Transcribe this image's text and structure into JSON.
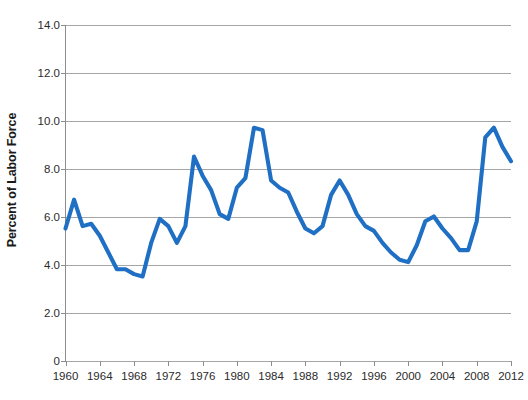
{
  "chart_data": {
    "type": "line",
    "title": "",
    "xlabel": "",
    "ylabel": "Percent of Labor Force",
    "ylim": [
      0,
      14
    ],
    "xlim": [
      1960,
      2012
    ],
    "grid": true,
    "legend": false,
    "line_color": "#1f6fc4",
    "y_ticks": [
      "0",
      "2.0",
      "4.0",
      "6.0",
      "8.0",
      "10.0",
      "12.0",
      "14.0"
    ],
    "y_tick_values": [
      0,
      2,
      4,
      6,
      8,
      10,
      12,
      14
    ],
    "x_ticks": [
      "1960",
      "1964",
      "1968",
      "1972",
      "1976",
      "1980",
      "1984",
      "1988",
      "1992",
      "1996",
      "2000",
      "2004",
      "2008",
      "2012"
    ],
    "x_tick_values": [
      1960,
      1964,
      1968,
      1972,
      1976,
      1980,
      1984,
      1988,
      1992,
      1996,
      2000,
      2004,
      2008,
      2012
    ],
    "series": [
      {
        "name": "Percent of Labor Force",
        "x": [
          1960,
          1961,
          1962,
          1963,
          1964,
          1965,
          1966,
          1967,
          1968,
          1969,
          1970,
          1971,
          1972,
          1973,
          1974,
          1975,
          1976,
          1977,
          1978,
          1979,
          1980,
          1981,
          1982,
          1983,
          1984,
          1985,
          1986,
          1987,
          1988,
          1989,
          1990,
          1991,
          1992,
          1993,
          1994,
          1995,
          1996,
          1997,
          1998,
          1999,
          2000,
          2001,
          2002,
          2003,
          2004,
          2005,
          2006,
          2007,
          2008,
          2009,
          2010,
          2011,
          2012
        ],
        "values": [
          5.5,
          6.7,
          5.6,
          5.7,
          5.2,
          4.5,
          3.8,
          3.8,
          3.6,
          3.5,
          4.9,
          5.9,
          5.6,
          4.9,
          5.6,
          8.5,
          7.7,
          7.1,
          6.1,
          5.9,
          7.2,
          7.6,
          9.7,
          9.6,
          7.5,
          7.2,
          7.0,
          6.2,
          5.5,
          5.3,
          5.6,
          6.9,
          7.5,
          6.9,
          6.1,
          5.6,
          5.4,
          4.9,
          4.5,
          4.2,
          4.1,
          4.8,
          5.8,
          6.0,
          5.5,
          5.1,
          4.6,
          4.6,
          5.8,
          9.3,
          9.7,
          8.9,
          8.3
        ]
      }
    ]
  },
  "axis": {
    "y_title": "Percent of Labor Force"
  }
}
